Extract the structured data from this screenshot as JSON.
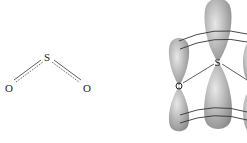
{
  "structure": {
    "central_atom": "S",
    "left_atom": "O",
    "right_atom": "O",
    "bond_style": "partial-double (solid + dotted)"
  },
  "orbital_diagram": {
    "atoms": [
      "O",
      "S"
    ],
    "orbital_type": "p-orbitals",
    "lobe_color": "#a6a6a6"
  }
}
